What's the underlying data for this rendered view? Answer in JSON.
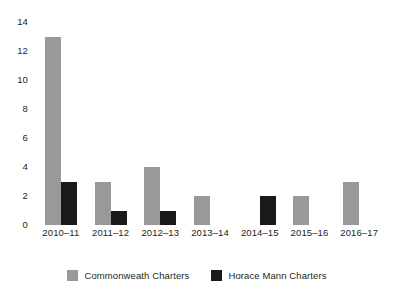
{
  "chart_data": {
    "type": "bar",
    "title": "",
    "subtitle": "",
    "xlabel": "",
    "ylabel": "",
    "ylim": [
      0,
      14
    ],
    "yticks": [
      0,
      2,
      4,
      6,
      8,
      10,
      12,
      14
    ],
    "grid": false,
    "legend_position": "bottom-center",
    "categories": [
      "2010–11",
      "2011–12",
      "2012–13",
      "2013–14",
      "2014–15",
      "2015–16",
      "2016–17"
    ],
    "series": [
      {
        "name": "Commonweath Charters",
        "color": "#999999",
        "values": [
          13,
          3,
          4,
          2,
          0,
          2,
          3
        ]
      },
      {
        "name": "Horace Mann Charters",
        "color": "#1a1a1a",
        "values": [
          3,
          1,
          1,
          0,
          2,
          0,
          0
        ]
      }
    ]
  }
}
